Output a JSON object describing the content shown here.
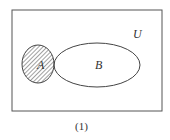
{
  "diagram": {
    "type": "venn",
    "universe_label": "U",
    "set_a_label": "A",
    "set_b_label": "B",
    "shaded_region": "A minus B",
    "caption": "(1)",
    "colors": {
      "stroke": "#444444",
      "hatch": "#444444",
      "background": "#ffffff"
    }
  }
}
